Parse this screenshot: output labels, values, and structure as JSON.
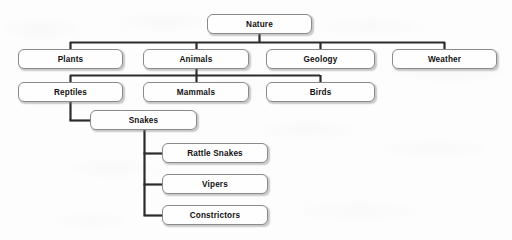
{
  "diagram": {
    "style": {
      "background_color": "#fdfdfd",
      "node_fill": "#fefefe",
      "node_border": "#8a8a8a",
      "connector_color": "#2b2b2b",
      "text_color": "#111111"
    },
    "nodes": [
      {
        "id": "nature",
        "label": "Nature",
        "level": 0,
        "x": 207,
        "y": 14,
        "w": 105,
        "h": 20
      },
      {
        "id": "plants",
        "label": "Plants",
        "level": 1,
        "x": 18,
        "y": 49,
        "w": 105,
        "h": 20
      },
      {
        "id": "animals",
        "label": "Animals",
        "level": 1,
        "x": 143,
        "y": 49,
        "w": 106,
        "h": 20
      },
      {
        "id": "geology",
        "label": "Geology",
        "level": 1,
        "x": 266,
        "y": 49,
        "w": 109,
        "h": 20
      },
      {
        "id": "weather",
        "label": "Weather",
        "level": 1,
        "x": 392,
        "y": 49,
        "w": 105,
        "h": 20
      },
      {
        "id": "reptiles",
        "label": "Reptiles",
        "level": 2,
        "x": 18,
        "y": 82,
        "w": 105,
        "h": 20
      },
      {
        "id": "mammals",
        "label": "Mammals",
        "level": 2,
        "x": 143,
        "y": 82,
        "w": 106,
        "h": 20
      },
      {
        "id": "birds",
        "label": "Birds",
        "level": 2,
        "x": 266,
        "y": 82,
        "w": 109,
        "h": 20
      },
      {
        "id": "snakes",
        "label": "Snakes",
        "level": 3,
        "x": 90,
        "y": 110,
        "w": 107,
        "h": 20
      },
      {
        "id": "rattlesnakes",
        "label": "Rattle Snakes",
        "level": 4,
        "x": 162,
        "y": 143,
        "w": 106,
        "h": 20
      },
      {
        "id": "vipers",
        "label": "Vipers",
        "level": 4,
        "x": 162,
        "y": 174,
        "w": 106,
        "h": 20
      },
      {
        "id": "constrictors",
        "label": "Constrictors",
        "level": 4,
        "x": 162,
        "y": 205,
        "w": 106,
        "h": 20
      }
    ],
    "edges": [
      {
        "from": "nature",
        "to": "plants"
      },
      {
        "from": "nature",
        "to": "animals"
      },
      {
        "from": "nature",
        "to": "geology"
      },
      {
        "from": "nature",
        "to": "weather"
      },
      {
        "from": "animals",
        "to": "reptiles"
      },
      {
        "from": "animals",
        "to": "mammals"
      },
      {
        "from": "animals",
        "to": "birds"
      },
      {
        "from": "reptiles",
        "to": "snakes"
      },
      {
        "from": "snakes",
        "to": "rattlesnakes"
      },
      {
        "from": "snakes",
        "to": "vipers"
      },
      {
        "from": "snakes",
        "to": "constrictors"
      }
    ]
  }
}
